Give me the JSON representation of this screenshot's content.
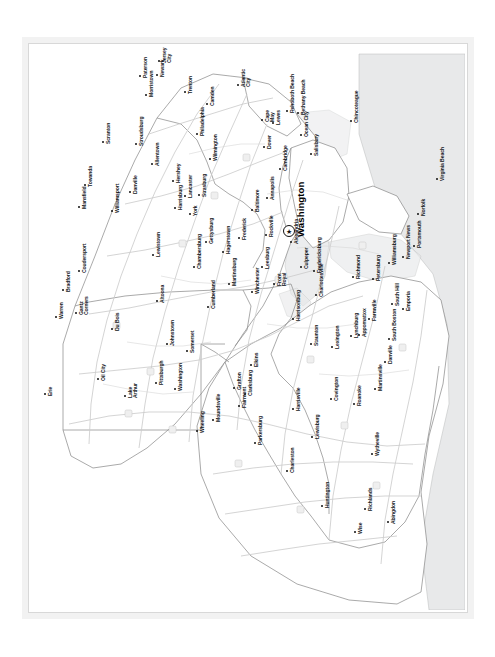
{
  "document": {
    "type": "scanned-map-page",
    "orientation": "map printed sideways; place labels rotated 90 degrees counter-clockwise",
    "region_title": "Mid-Atlantic States Road Map",
    "background_color": "#ffffff",
    "frame_color": "#d8d8d8",
    "land_color": "#ffffff",
    "water_color": "#e9e9e9",
    "road_color": "#c9c9c9",
    "border_color": "#8f8f8f",
    "label_color": "#15181c"
  },
  "capital": {
    "name": "Washington",
    "marker": "star-in-circle",
    "x": 289,
    "y": 231
  },
  "cities": [
    {
      "name": "Jersey City",
      "x": 160,
      "y": 62,
      "lines": [
        "Jersey",
        "City"
      ]
    },
    {
      "name": "Newark",
      "x": 158,
      "y": 76,
      "lines": [
        "Newark"
      ]
    },
    {
      "name": "Paterson",
      "x": 141,
      "y": 77,
      "lines": [
        "Paterson"
      ]
    },
    {
      "name": "Morristown",
      "x": 147,
      "y": 96,
      "lines": [
        "Morristown"
      ]
    },
    {
      "name": "Trenton",
      "x": 186,
      "y": 93,
      "lines": [
        "Trenton"
      ]
    },
    {
      "name": "Camden",
      "x": 208,
      "y": 105,
      "lines": [
        "Camden"
      ]
    },
    {
      "name": "Atlantic City",
      "x": 239,
      "y": 86,
      "lines": [
        "Atlantic",
        "City"
      ]
    },
    {
      "name": "Philadelphia",
      "x": 198,
      "y": 135,
      "lines": [
        "Philadelphia"
      ]
    },
    {
      "name": "Wilmington",
      "x": 211,
      "y": 160,
      "lines": [
        "Wilmington"
      ]
    },
    {
      "name": "Cape May",
      "x": 263,
      "y": 121,
      "lines": [
        "Cape",
        "May"
      ]
    },
    {
      "name": "Lewes",
      "x": 274,
      "y": 124,
      "lines": [
        "Lewes"
      ]
    },
    {
      "name": "Rehoboth Beach",
      "x": 288,
      "y": 112,
      "lines": [
        "Rehoboth Beach"
      ]
    },
    {
      "name": "Bethany Beach",
      "x": 299,
      "y": 114,
      "lines": [
        "Bethany Beach"
      ]
    },
    {
      "name": "Ocean City",
      "x": 302,
      "y": 136,
      "lines": [
        "Ocean City"
      ]
    },
    {
      "name": "Dover",
      "x": 265,
      "y": 148,
      "lines": [
        "Dover"
      ]
    },
    {
      "name": "Salisbury",
      "x": 312,
      "y": 155,
      "lines": [
        "Salisbury"
      ]
    },
    {
      "name": "Chincoteague",
      "x": 352,
      "y": 122,
      "lines": [
        "Chincoteague"
      ]
    },
    {
      "name": "Cambridge",
      "x": 281,
      "y": 170,
      "lines": [
        "Cambridge"
      ]
    },
    {
      "name": "Annapolis",
      "x": 268,
      "y": 199,
      "lines": [
        "Annapolis"
      ]
    },
    {
      "name": "Baltimore",
      "x": 253,
      "y": 211,
      "lines": [
        "Baltimore"
      ]
    },
    {
      "name": "Rockville",
      "x": 267,
      "y": 236,
      "lines": [
        "Rockville"
      ]
    },
    {
      "name": "Alexandria",
      "x": 292,
      "y": 243,
      "lines": [
        "Alexandria"
      ]
    },
    {
      "name": "Frederick",
      "x": 240,
      "y": 239,
      "lines": [
        "Frederick"
      ]
    },
    {
      "name": "Hagerstown",
      "x": 224,
      "y": 253,
      "lines": [
        "Hagerstown"
      ]
    },
    {
      "name": "Gettysburg",
      "x": 207,
      "y": 243,
      "lines": [
        "Gettysburg"
      ]
    },
    {
      "name": "Chambersburg",
      "x": 195,
      "y": 268,
      "lines": [
        "Chambersburg"
      ]
    },
    {
      "name": "York",
      "x": 191,
      "y": 215,
      "lines": [
        "York"
      ]
    },
    {
      "name": "Lancaster",
      "x": 186,
      "y": 197,
      "lines": [
        "Lancaster"
      ]
    },
    {
      "name": "Strasburg",
      "x": 200,
      "y": 196,
      "lines": [
        "Strasburg"
      ]
    },
    {
      "name": "Hershey",
      "x": 174,
      "y": 182,
      "lines": [
        "Hershey"
      ]
    },
    {
      "name": "Harrisburg",
      "x": 176,
      "y": 209,
      "lines": [
        "Harrisburg"
      ]
    },
    {
      "name": "Allentown",
      "x": 153,
      "y": 165,
      "lines": [
        "Allentown"
      ]
    },
    {
      "name": "Stroudsburg",
      "x": 137,
      "y": 145,
      "lines": [
        "Stroudsburg"
      ]
    },
    {
      "name": "Scranton",
      "x": 104,
      "y": 143,
      "lines": [
        "Scranton"
      ]
    },
    {
      "name": "Towanda",
      "x": 86,
      "y": 186,
      "lines": [
        "Towanda"
      ]
    },
    {
      "name": "Mansfield",
      "x": 80,
      "y": 208,
      "lines": [
        "Mansfield"
      ]
    },
    {
      "name": "Danville",
      "x": 131,
      "y": 193,
      "lines": [
        "Danville"
      ]
    },
    {
      "name": "Williamsport",
      "x": 113,
      "y": 212,
      "lines": [
        "Williamsport"
      ]
    },
    {
      "name": "Lewistown",
      "x": 154,
      "y": 256,
      "lines": [
        "Lewistown"
      ]
    },
    {
      "name": "Coudersport",
      "x": 80,
      "y": 272,
      "lines": [
        "Coudersport"
      ]
    },
    {
      "name": "Bradford",
      "x": 64,
      "y": 291,
      "lines": [
        "Bradford"
      ]
    },
    {
      "name": "Warren",
      "x": 57,
      "y": 318,
      "lines": [
        "Warren"
      ]
    },
    {
      "name": "Gantz Corners",
      "x": 77,
      "y": 314,
      "lines": [
        "Gantz",
        "Corners"
      ]
    },
    {
      "name": "Du Bois",
      "x": 113,
      "y": 330,
      "lines": [
        "Du Bois"
      ]
    },
    {
      "name": "Altoona",
      "x": 158,
      "y": 302,
      "lines": [
        "Altoona"
      ]
    },
    {
      "name": "Johnstown",
      "x": 168,
      "y": 345,
      "lines": [
        "Johnstown"
      ]
    },
    {
      "name": "Somerset",
      "x": 188,
      "y": 352,
      "lines": [
        "Somerset"
      ]
    },
    {
      "name": "Oil City",
      "x": 99,
      "y": 380,
      "lines": [
        "Oil City"
      ]
    },
    {
      "name": "Lake Arthur",
      "x": 126,
      "y": 397,
      "lines": [
        "Lake",
        "Arthur"
      ]
    },
    {
      "name": "Pittsburgh",
      "x": 157,
      "y": 384,
      "lines": [
        "Pittsburgh"
      ]
    },
    {
      "name": "Washington PA",
      "x": 176,
      "y": 390,
      "lines": [
        "Washington"
      ]
    },
    {
      "name": "Erie",
      "x": 46,
      "y": 395,
      "lines": [
        "Erie"
      ]
    },
    {
      "name": "Cumberland",
      "x": 209,
      "y": 308,
      "lines": [
        "Cumberland"
      ]
    },
    {
      "name": "Martinsburg",
      "x": 230,
      "y": 285,
      "lines": [
        "Martinsburg"
      ]
    },
    {
      "name": "Winchester",
      "x": 253,
      "y": 293,
      "lines": [
        "Winchester"
      ]
    },
    {
      "name": "Leesburg",
      "x": 263,
      "y": 268,
      "lines": [
        "Leesburg"
      ]
    },
    {
      "name": "Front Royal",
      "x": 275,
      "y": 285,
      "lines": [
        "Front",
        "Royal"
      ]
    },
    {
      "name": "Culpeper",
      "x": 302,
      "y": 268,
      "lines": [
        "Culpeper"
      ]
    },
    {
      "name": "Fredericksburg",
      "x": 315,
      "y": 272,
      "lines": [
        "Fredericksburg"
      ]
    },
    {
      "name": "Charlottesville",
      "x": 317,
      "y": 296,
      "lines": [
        "Charlottesville"
      ]
    },
    {
      "name": "Harrisonburg",
      "x": 294,
      "y": 320,
      "lines": [
        "Harrisonburg"
      ]
    },
    {
      "name": "Staunton",
      "x": 312,
      "y": 345,
      "lines": [
        "Staunton"
      ]
    },
    {
      "name": "Lexington",
      "x": 333,
      "y": 348,
      "lines": [
        "Lexington"
      ]
    },
    {
      "name": "Lynchburg",
      "x": 352,
      "y": 337,
      "lines": [
        "Lynchburg"
      ]
    },
    {
      "name": "Appomattox",
      "x": 360,
      "y": 336,
      "lines": [
        "Appomattox"
      ]
    },
    {
      "name": "Farmville",
      "x": 370,
      "y": 320,
      "lines": [
        "Farmville"
      ]
    },
    {
      "name": "Richmond",
      "x": 354,
      "y": 278,
      "lines": [
        "Richmond"
      ]
    },
    {
      "name": "Petersburg",
      "x": 374,
      "y": 280,
      "lines": [
        "Petersburg"
      ]
    },
    {
      "name": "Williamsburg",
      "x": 390,
      "y": 264,
      "lines": [
        "Williamsburg"
      ]
    },
    {
      "name": "Newport News",
      "x": 404,
      "y": 258,
      "lines": [
        "Newport News"
      ]
    },
    {
      "name": "Portsmouth",
      "x": 415,
      "y": 247,
      "lines": [
        "Portsmouth"
      ]
    },
    {
      "name": "Norfolk",
      "x": 419,
      "y": 215,
      "lines": [
        "Norfolk"
      ]
    },
    {
      "name": "Virginia Beach",
      "x": 438,
      "y": 180,
      "lines": [
        "Virginia Beach"
      ]
    },
    {
      "name": "South Hill",
      "x": 393,
      "y": 305,
      "lines": [
        "South Hill"
      ]
    },
    {
      "name": "Emporia",
      "x": 404,
      "y": 310,
      "lines": [
        "Emporia"
      ]
    },
    {
      "name": "South Boston",
      "x": 390,
      "y": 340,
      "lines": [
        "South Boston"
      ]
    },
    {
      "name": "Danville VA",
      "x": 386,
      "y": 363,
      "lines": [
        "Danville"
      ]
    },
    {
      "name": "Martinsville",
      "x": 376,
      "y": 390,
      "lines": [
        "Martinsville"
      ]
    },
    {
      "name": "Roanoke",
      "x": 355,
      "y": 405,
      "lines": [
        "Roanoke"
      ]
    },
    {
      "name": "Covington",
      "x": 332,
      "y": 400,
      "lines": [
        "Covington"
      ]
    },
    {
      "name": "Lewisburg",
      "x": 313,
      "y": 438,
      "lines": [
        "Lewisburg"
      ]
    },
    {
      "name": "Wytheville",
      "x": 373,
      "y": 455,
      "lines": [
        "Wytheville"
      ]
    },
    {
      "name": "Richlands",
      "x": 366,
      "y": 510,
      "lines": [
        "Richlands"
      ]
    },
    {
      "name": "Abingdon",
      "x": 389,
      "y": 523,
      "lines": [
        "Abingdon"
      ]
    },
    {
      "name": "Wise",
      "x": 356,
      "y": 533,
      "lines": [
        "Wise"
      ]
    },
    {
      "name": "Charleston",
      "x": 288,
      "y": 472,
      "lines": [
        "Charleston"
      ]
    },
    {
      "name": "Huntington",
      "x": 323,
      "y": 507,
      "lines": [
        "Huntington"
      ]
    },
    {
      "name": "Harrisville",
      "x": 294,
      "y": 410,
      "lines": [
        "Harrisville"
      ]
    },
    {
      "name": "Parkersburg",
      "x": 256,
      "y": 444,
      "lines": [
        "Parkersburg"
      ]
    },
    {
      "name": "Fairmont",
      "x": 240,
      "y": 407,
      "lines": [
        "Fairmont"
      ]
    },
    {
      "name": "Grafton",
      "x": 235,
      "y": 389,
      "lines": [
        "Grafton"
      ]
    },
    {
      "name": "Clarksburg",
      "x": 246,
      "y": 395,
      "lines": [
        "Clarksburg"
      ]
    },
    {
      "name": "Elkins",
      "x": 252,
      "y": 366,
      "lines": [
        "Elkins"
      ]
    },
    {
      "name": "Moundsville",
      "x": 214,
      "y": 421,
      "lines": [
        "Moundsville"
      ]
    },
    {
      "name": "Wheeling",
      "x": 198,
      "y": 432,
      "lines": [
        "Wheeling"
      ]
    }
  ]
}
